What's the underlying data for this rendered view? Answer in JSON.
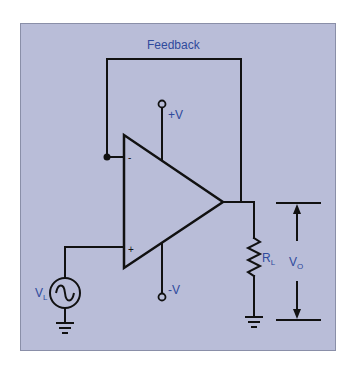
{
  "diagram": {
    "colors": {
      "background": "#b9bdd8",
      "wire": "#111111",
      "label": "#2f4a9c"
    },
    "labels": {
      "feedback": "Feedback",
      "positive_supply": "+V",
      "negative_supply": "-V",
      "inverting_input": "-",
      "noninverting_input": "+",
      "source_main": "V",
      "source_sub": "L",
      "load_main": "R",
      "load_sub": "L",
      "output_main": "V",
      "output_sub": "O"
    },
    "components": [
      {
        "name": "op-amp",
        "type": "operational-amplifier"
      },
      {
        "name": "ac-source",
        "type": "voltage-source",
        "label": "VL"
      },
      {
        "name": "load-resistor",
        "type": "resistor",
        "label": "RL"
      },
      {
        "name": "output-voltage",
        "type": "voltage-indicator",
        "label": "VO"
      },
      {
        "name": "feedback-path",
        "type": "wire",
        "label": "Feedback"
      },
      {
        "name": "ground-source",
        "type": "ground"
      },
      {
        "name": "ground-load",
        "type": "ground"
      }
    ]
  }
}
